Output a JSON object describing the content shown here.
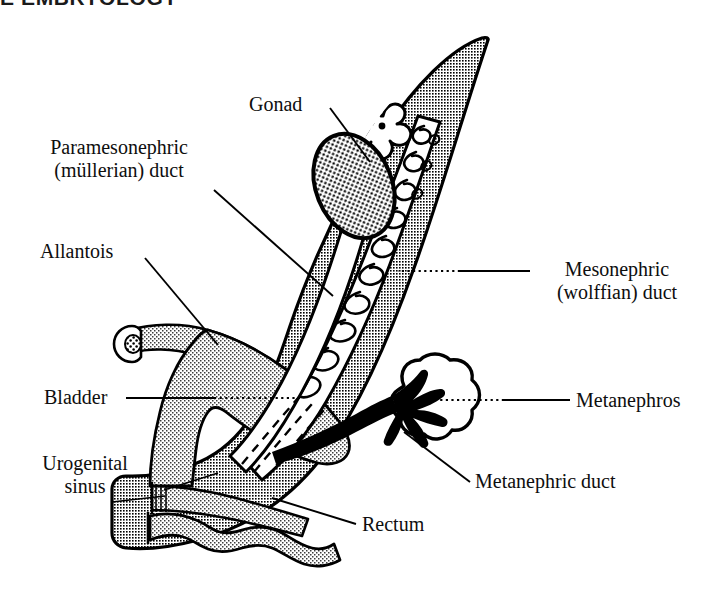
{
  "page": {
    "heading": "E EMBRYOLOGY",
    "background_color": "#ffffff",
    "text_color": "#0e0e0e"
  },
  "figure": {
    "colors": {
      "body_fill": "#9c9c9c",
      "organ_light_fill": "#c9c9c9",
      "duct_fill": "#ffffff",
      "outline": "#000000",
      "stipple": "#000000"
    },
    "labels": {
      "gonad": "Gonad",
      "paramesonephric_line1": "Paramesonephric",
      "paramesonephric_line2": "(müllerian) duct",
      "allantois": "Allantois",
      "bladder": "Bladder",
      "urogenital_line1": "Urogenital",
      "urogenital_line2": "sinus",
      "mesonephric_line1": "Mesonephric",
      "mesonephric_line2": "(wolffian) duct",
      "metanephros": "Metanephros",
      "metanephric_duct": "Metanephric duct",
      "rectum": "Rectum"
    },
    "structures": [
      {
        "name": "body-wall",
        "label": "",
        "fill": "#9c9c9c",
        "pattern": "halftone-50"
      },
      {
        "name": "gonad",
        "label": "Gonad",
        "fill": "#ffffff",
        "pattern": "stipple-dots"
      },
      {
        "name": "paramesonephric-duct",
        "label": "Paramesonephric (müllerian) duct",
        "fill": "#ffffff",
        "pattern": "solid"
      },
      {
        "name": "mesonephric-duct",
        "label": "Mesonephric (wolffian) duct",
        "fill": "#ffffff",
        "pattern": "solid"
      },
      {
        "name": "allantois",
        "label": "Allantois",
        "fill": "#c9c9c9",
        "pattern": "halftone-25"
      },
      {
        "name": "bladder",
        "label": "Bladder",
        "fill": "#c9c9c9",
        "pattern": "halftone-25"
      },
      {
        "name": "urogenital-sinus",
        "label": "Urogenital sinus",
        "fill": "#c9c9c9",
        "pattern": "halftone-25"
      },
      {
        "name": "metanephros",
        "label": "Metanephros",
        "fill": "#ffffff",
        "pattern": "solid"
      },
      {
        "name": "metanephric-duct",
        "label": "Metanephric duct",
        "fill": "#000000",
        "pattern": "solid"
      },
      {
        "name": "rectum",
        "label": "Rectum",
        "fill": "#c9c9c9",
        "pattern": "halftone-25"
      }
    ],
    "leader_lines": [
      {
        "name": "gonad-leader",
        "style": "solid",
        "from": "Gonad",
        "to": "gonad"
      },
      {
        "name": "paramesonephric-leader",
        "style": "solid",
        "from": "Paramesonephric duct",
        "to": "paramesonephric-duct"
      },
      {
        "name": "allantois-leader",
        "style": "solid",
        "from": "Allantois",
        "to": "allantois"
      },
      {
        "name": "bladder-leader",
        "style": "solid-dotted",
        "from": "Bladder",
        "to": "bladder"
      },
      {
        "name": "urogenital-sinus-leader",
        "style": "solid",
        "from": "Urogenital sinus",
        "to": "urogenital-sinus"
      },
      {
        "name": "mesonephric-leader",
        "style": "solid-dotted",
        "from": "Mesonephric duct",
        "to": "mesonephric-duct"
      },
      {
        "name": "metanephros-leader",
        "style": "solid-dotted",
        "from": "Metanephros",
        "to": "metanephros"
      },
      {
        "name": "metanephric-duct-leader",
        "style": "solid",
        "from": "Metanephric duct",
        "to": "metanephric-duct"
      },
      {
        "name": "rectum-leader",
        "style": "solid",
        "from": "Rectum",
        "to": "rectum"
      }
    ]
  }
}
